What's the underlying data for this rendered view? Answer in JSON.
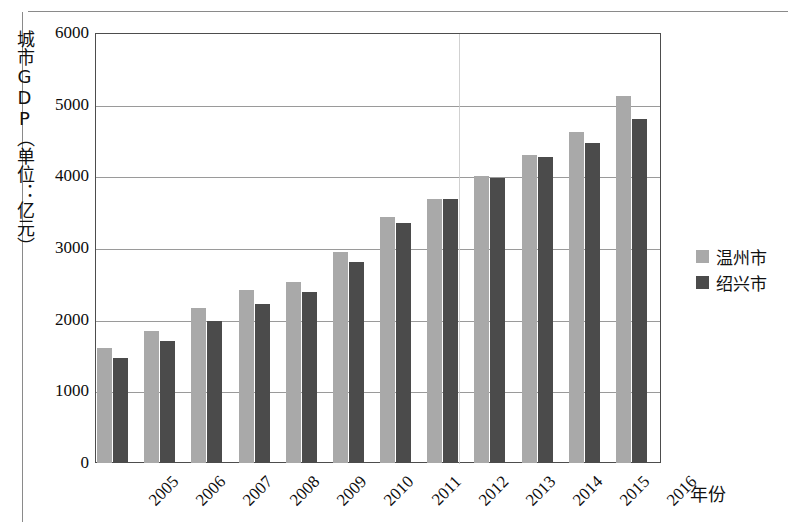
{
  "chart_data": {
    "type": "bar",
    "title": "",
    "ylabel": "城市GDP（单位：亿元）",
    "xlabel": "年份",
    "ylim": [
      0,
      6000
    ],
    "yticks": [
      0,
      1000,
      2000,
      3000,
      4000,
      5000,
      6000
    ],
    "ytick_labels": [
      "0",
      "1000",
      "2000",
      "3000",
      "4000",
      "5000",
      "6000"
    ],
    "grid": true,
    "legend_position": "right",
    "categories": [
      "2005",
      "2006",
      "2007",
      "2008",
      "2009",
      "2010",
      "2011",
      "2012",
      "2013",
      "2014",
      "2015",
      "2016"
    ],
    "series": [
      {
        "name": "温州市",
        "color": "#a9a9a9",
        "values": [
          1610,
          1840,
          2160,
          2420,
          2530,
          2940,
          3430,
          3690,
          4000,
          4300,
          4620,
          5120
        ]
      },
      {
        "name": "绍兴市",
        "color": "#4b4b4b",
        "values": [
          1460,
          1700,
          1980,
          2220,
          2380,
          2800,
          3350,
          3680,
          3980,
          4270,
          4470,
          4800
        ]
      }
    ]
  },
  "legend": {
    "items": [
      {
        "label": "温州市",
        "color": "#a9a9a9"
      },
      {
        "label": "绍兴市",
        "color": "#4b4b4b"
      }
    ]
  },
  "axes": {
    "y_title": "城市GDP（单位：亿元）",
    "x_title": "年份"
  }
}
